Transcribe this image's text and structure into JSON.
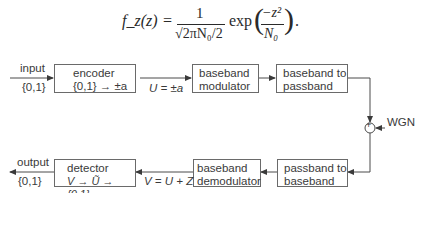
{
  "equation": {
    "lhs": "f_z(z)",
    "equals": "=",
    "numerator": "1",
    "denominator": "√2πN₀/2",
    "function": "exp",
    "exp_numerator": "−z²",
    "exp_denominator": "N₀",
    "trailing": "."
  },
  "diagram": {
    "forward_path": {
      "input_label": "input",
      "input_alphabet": "{0,1}",
      "encoder": {
        "line1": "encoder",
        "line2": "{0,1} → ±a"
      },
      "encoder_output_label": "U = ±a",
      "modulator": {
        "line1": "baseband",
        "line2": "modulator"
      },
      "upconverter": {
        "line1": "baseband to",
        "line2": "passband"
      }
    },
    "channel": {
      "adder_symbol": "+",
      "noise_label": "WGN"
    },
    "return_path": {
      "downconverter": {
        "line1": "passband to",
        "line2": "baseband"
      },
      "demodulator": {
        "line1": "baseband",
        "line2": "demodulator"
      },
      "demod_output_label": "V = U + Z",
      "detector": {
        "line1": "detector",
        "line2": "V → Ũ → {0,1}"
      },
      "output_label": "output",
      "output_alphabet": "{0,1}"
    }
  }
}
